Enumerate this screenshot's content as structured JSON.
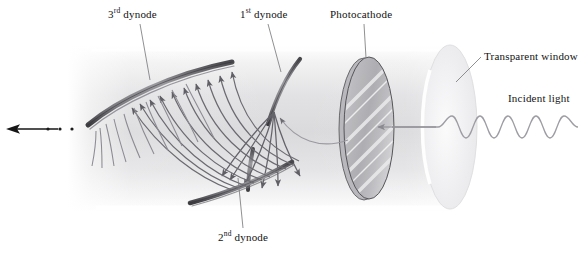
{
  "figure": {
    "width": 578,
    "height": 254,
    "background_color": "#ffffff"
  },
  "labels": {
    "dynode3": {
      "text_prefix": "3",
      "superscript": "rd",
      "text_suffix": " dynode",
      "full": "3rd dynode"
    },
    "dynode1": {
      "text_prefix": "1",
      "superscript": "st",
      "text_suffix": " dynode",
      "full": "1st dynode"
    },
    "dynode2": {
      "text_prefix": "2",
      "superscript": "nd",
      "text_suffix": " dynode",
      "full": "2nd dynode"
    },
    "photocathode": {
      "full": "Photocathode"
    },
    "transparent_window": {
      "full": "Transparent window"
    },
    "incident_light": {
      "full": "Incident light"
    }
  },
  "colors": {
    "label_text": "#121212",
    "leader_line": "#7c7c80",
    "dynode_stroke": "#3c3c40",
    "dynode_fill": "#8e8e92",
    "electron_track": "#6e6e74",
    "tube_body_light": "#f4f4f5",
    "tube_body_mid": "#dcdcde",
    "photocathode_fill": "#b5b5b8",
    "photocathode_stroke": "#5a5a5e",
    "window_fill": "#eeeef0",
    "wave_stroke": "#9a9aa0",
    "output_arrow": "#161616"
  },
  "elements": {
    "tube": {
      "name": "vacuum-tube-body",
      "x_start": 68,
      "x_end": 470,
      "y_top": 46,
      "y_bottom": 212
    },
    "photocathode_disc": {
      "cx": 368,
      "cy": 128,
      "rx": 26,
      "ry": 72,
      "hatch_lines": 5
    },
    "window_disc": {
      "cx": 450,
      "cy": 127,
      "rx": 27,
      "ry": 82
    },
    "incident_wave": {
      "cycles": 5,
      "x_start": 440,
      "x_end": 578,
      "baseline_y": 127,
      "amplitude": 11
    },
    "output_arrow": {
      "x_tip": 8,
      "x_tail": 58,
      "y": 129,
      "dots": 3
    },
    "dynode1": {
      "name": "first-dynode",
      "electron_fan_count": 8
    },
    "dynode2": {
      "name": "second-dynode",
      "electron_fan_count": 12
    },
    "dynode3": {
      "name": "third-dynode",
      "electron_fan_count": 10
    }
  }
}
